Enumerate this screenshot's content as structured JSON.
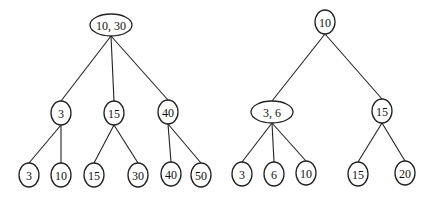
{
  "trees": [
    {
      "id": "left-tree",
      "nodes": [
        {
          "id": "L0",
          "label": "10, 30",
          "x": 111,
          "y": 25,
          "rx": 21,
          "ry": 11
        },
        {
          "id": "L1",
          "label": "3",
          "x": 61,
          "y": 113,
          "rx": 10,
          "ry": 12
        },
        {
          "id": "L2",
          "label": "15",
          "x": 114,
          "y": 113,
          "rx": 10,
          "ry": 12
        },
        {
          "id": "L3",
          "label": "40",
          "x": 168,
          "y": 112,
          "rx": 10,
          "ry": 12
        },
        {
          "id": "L4",
          "label": "3",
          "x": 29,
          "y": 175,
          "rx": 10,
          "ry": 12
        },
        {
          "id": "L5",
          "label": "10",
          "x": 61,
          "y": 175,
          "rx": 10,
          "ry": 12
        },
        {
          "id": "L6",
          "label": "15",
          "x": 94,
          "y": 175,
          "rx": 10,
          "ry": 12
        },
        {
          "id": "L7",
          "label": "30",
          "x": 138,
          "y": 175,
          "rx": 10,
          "ry": 12
        },
        {
          "id": "L8",
          "label": "40",
          "x": 171,
          "y": 174,
          "rx": 10,
          "ry": 12
        },
        {
          "id": "L9",
          "label": "50",
          "x": 201,
          "y": 175,
          "rx": 10,
          "ry": 12
        }
      ],
      "edges": [
        [
          "L0",
          "L1"
        ],
        [
          "L0",
          "L2"
        ],
        [
          "L0",
          "L3"
        ],
        [
          "L1",
          "L4"
        ],
        [
          "L1",
          "L5"
        ],
        [
          "L2",
          "L6"
        ],
        [
          "L2",
          "L7"
        ],
        [
          "L3",
          "L8"
        ],
        [
          "L3",
          "L9"
        ]
      ]
    },
    {
      "id": "right-tree",
      "nodes": [
        {
          "id": "R0",
          "label": "10",
          "x": 325,
          "y": 22,
          "rx": 10,
          "ry": 12
        },
        {
          "id": "R1",
          "label": "3, 6",
          "x": 272,
          "y": 112,
          "rx": 21,
          "ry": 11
        },
        {
          "id": "R2",
          "label": "15",
          "x": 382,
          "y": 111,
          "rx": 10,
          "ry": 12
        },
        {
          "id": "R3",
          "label": "3",
          "x": 242,
          "y": 174,
          "rx": 10,
          "ry": 12
        },
        {
          "id": "R4",
          "label": "6",
          "x": 274,
          "y": 174,
          "rx": 10,
          "ry": 12
        },
        {
          "id": "R5",
          "label": "10",
          "x": 306,
          "y": 173,
          "rx": 10,
          "ry": 12
        },
        {
          "id": "R6",
          "label": "15",
          "x": 358,
          "y": 174,
          "rx": 10,
          "ry": 12
        },
        {
          "id": "R7",
          "label": "20",
          "x": 405,
          "y": 173,
          "rx": 10,
          "ry": 12
        }
      ],
      "edges": [
        [
          "R0",
          "R1"
        ],
        [
          "R0",
          "R2"
        ],
        [
          "R1",
          "R3"
        ],
        [
          "R1",
          "R4"
        ],
        [
          "R1",
          "R5"
        ],
        [
          "R2",
          "R6"
        ],
        [
          "R2",
          "R7"
        ]
      ]
    }
  ]
}
